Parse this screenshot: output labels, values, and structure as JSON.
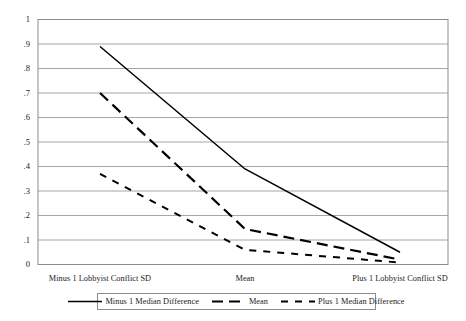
{
  "chart_data": {
    "type": "line",
    "title": "",
    "xlabel": "",
    "ylabel": "",
    "grid": true,
    "legend_position": "bottom",
    "categories": [
      "Minus 1 Lobbyist Conflict SD",
      "Mean",
      "Plus 1 Lobbyist Conflict SD"
    ],
    "ylim": [
      0,
      1
    ],
    "yticks": [
      0,
      0.1,
      0.2,
      0.3,
      0.4,
      0.5,
      0.6,
      0.7,
      0.8,
      0.9,
      1
    ],
    "ytick_labels": [
      "0",
      ".1",
      ".2",
      ".3",
      ".4",
      ".5",
      ".6",
      ".7",
      ".8",
      ".9",
      "1"
    ],
    "series": [
      {
        "name": "Minus 1 Median Difference",
        "style": "solid",
        "color": "#000000",
        "values": [
          0.89,
          0.39,
          0.05
        ]
      },
      {
        "name": "Mean",
        "style": "long-dash",
        "color": "#000000",
        "values": [
          0.7,
          0.145,
          0.02
        ]
      },
      {
        "name": "Plus 1 Median Difference",
        "style": "short-dash",
        "color": "#000000",
        "values": [
          0.37,
          0.06,
          0.008
        ]
      }
    ]
  },
  "axes": {
    "ytick_labels": [
      "1",
      ".9",
      ".8",
      ".7",
      ".6",
      ".5",
      ".4",
      ".3",
      ".2",
      ".1",
      "0"
    ],
    "xtick_labels": [
      "Minus 1 Lobbyist Conflict SD",
      "Mean",
      "Plus 1 Lobbyist Conflict SD"
    ]
  },
  "legend": {
    "items": [
      {
        "label": "Minus 1 Median Difference"
      },
      {
        "label": "Mean"
      },
      {
        "label": "Plus 1 Median Difference"
      }
    ]
  },
  "colors": {
    "line": "#000000",
    "grid": "#a6a6a6",
    "frame": "#8c8c8c",
    "background": "#ffffff"
  }
}
